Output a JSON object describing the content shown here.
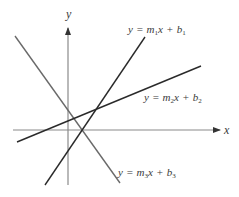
{
  "figure": {
    "width": 239,
    "height": 197,
    "background": "#ffffff"
  },
  "axes": {
    "color": "#8a8a8a",
    "arrow_color": "#333333",
    "x_axis": {
      "label": "x",
      "y": 130,
      "x_start": 13,
      "x_end": 220,
      "label_pos": [
        224,
        134
      ]
    },
    "y_axis": {
      "label": "y",
      "x": 68,
      "y_start": 185,
      "y_end": 28,
      "label_pos": [
        66,
        18
      ]
    }
  },
  "lines": [
    {
      "id": "line1",
      "equation": "y = m1x + b1",
      "label_parts": {
        "y": "y",
        "eq": "=",
        "m": "m",
        "m_sub": "1",
        "x": "x",
        "plus": "+",
        "b": "b",
        "b_sub": "1"
      },
      "stroke": "#2a2a2a",
      "from": [
        45,
        185
      ],
      "to": [
        145,
        37
      ],
      "label_pos": [
        128,
        33
      ]
    },
    {
      "id": "line2",
      "equation": "y = m2x + b2",
      "label_parts": {
        "y": "y",
        "eq": "=",
        "m": "m",
        "m_sub": "2",
        "x": "x",
        "plus": "+",
        "b": "b",
        "b_sub": "2"
      },
      "stroke": "#2a2a2a",
      "from": [
        17,
        142
      ],
      "to": [
        201,
        66
      ],
      "label_pos": [
        144,
        101
      ]
    },
    {
      "id": "line3",
      "equation": "y = m3x + b3",
      "label_parts": {
        "y": "y",
        "eq": "=",
        "m": "m",
        "m_sub": "3",
        "x": "x",
        "plus": "+",
        "b": "b",
        "b_sub": "3"
      },
      "stroke": "#6a6a6a",
      "from": [
        15,
        36
      ],
      "to": [
        120,
        183
      ],
      "label_pos": [
        118,
        176
      ]
    }
  ]
}
